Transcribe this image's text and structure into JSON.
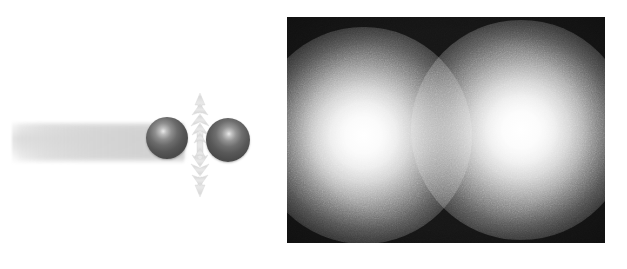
{
  "figure": {
    "caption": "",
    "background_color": "#ffffff",
    "width": 627,
    "height": 269
  },
  "schematic": {
    "label": "",
    "beam": {
      "name": "incident-beam",
      "color": "#d5d5d5",
      "description": "soft grey horizontal band entering from the left"
    },
    "particles": [
      {
        "name": "sphere-left",
        "color": "#565656",
        "highlight_color": "#e9e9e9",
        "center_x": 167,
        "center_y": 138,
        "radius": 21
      },
      {
        "name": "sphere-right",
        "color": "#585858",
        "highlight_color": "#eaeaea",
        "center_x": 228,
        "center_y": 140,
        "radius": 22
      }
    ],
    "interaction_marker": {
      "name": "vertical-double-arrow",
      "color": "#dcdcdc",
      "direction": "vertical",
      "heads": 2
    }
  },
  "camera_image": {
    "name": "fluorescence-image",
    "background_color": "#151515",
    "blob_color": "#ffffff",
    "noise": true,
    "spots": [
      {
        "name": "spot-left",
        "center_x": 363,
        "center_y": 135,
        "radius": 62,
        "peak_color": "#ffffff"
      },
      {
        "name": "spot-right",
        "center_x": 521,
        "center_y": 130,
        "radius": 63,
        "peak_color": "#ffffff"
      }
    ]
  }
}
